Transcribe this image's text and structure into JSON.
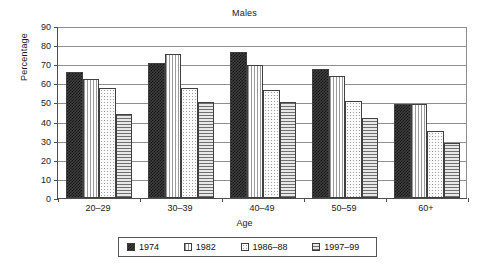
{
  "chart_data": {
    "type": "bar",
    "title": "Males",
    "xlabel": "Age",
    "ylabel": "Percentage",
    "categories": [
      "20–29",
      "30–39",
      "40–49",
      "50–59",
      "60+"
    ],
    "series": [
      {
        "name": "1974",
        "values": [
          66,
          70.5,
          76.5,
          67.5,
          49
        ]
      },
      {
        "name": "1982",
        "values": [
          62.5,
          75.5,
          69.5,
          64,
          49
        ]
      },
      {
        "name": "1986–88",
        "values": [
          57.5,
          57.5,
          56.5,
          51,
          35
        ]
      },
      {
        "name": "1997–99",
        "values": [
          44,
          50,
          50.5,
          42,
          29
        ]
      }
    ],
    "ylim": [
      0,
      90
    ],
    "yticks": [
      0,
      10,
      20,
      30,
      40,
      50,
      60,
      70,
      80,
      90
    ],
    "ytick_labels": [
      "0",
      "10",
      "20",
      "30",
      "40",
      "50",
      "60",
      "70",
      "80",
      "90"
    ],
    "grid": true,
    "grid_axis": "y",
    "legend_position": "bottom"
  }
}
